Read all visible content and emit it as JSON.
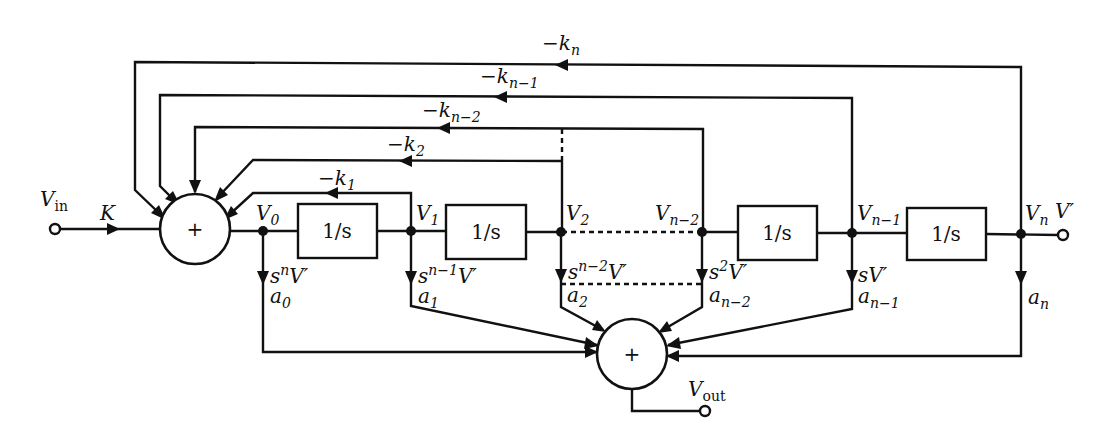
{
  "diagram": {
    "type": "block-diagram",
    "title": "",
    "input": {
      "label": "V",
      "sub": "in",
      "gain": "K"
    },
    "output": {
      "label": "V",
      "sub": "out"
    },
    "summers": {
      "input_sum": "+",
      "output_sum": "+"
    },
    "integrators": [
      "1/s",
      "1/s",
      "1/s",
      "1/s"
    ],
    "nodes": [
      {
        "id": "V0",
        "label": "V",
        "sub": "0",
        "tap": "s",
        "tap_sup": "n",
        "tap_tail": "V′",
        "coef": "a",
        "coef_sub": "0"
      },
      {
        "id": "V1",
        "label": "V",
        "sub": "1",
        "tap": "s",
        "tap_sup": "n−1",
        "tap_tail": "V′",
        "coef": "a",
        "coef_sub": "1"
      },
      {
        "id": "V2",
        "label": "V",
        "sub": "2",
        "tap": "s",
        "tap_sup": "n−2",
        "tap_tail": "V′",
        "coef": "a",
        "coef_sub": "2"
      },
      {
        "id": "Vn-2",
        "label": "V",
        "sub": "n−2",
        "tap": "s",
        "tap_sup": "2",
        "tap_tail": "V′",
        "coef": "a",
        "coef_sub": "n−2"
      },
      {
        "id": "Vn-1",
        "label": "V",
        "sub": "n−1",
        "tap": "sV′",
        "tap_sup": "",
        "tap_tail": "",
        "coef": "a",
        "coef_sub": "n−1"
      },
      {
        "id": "Vn",
        "label": "V",
        "sub": "n",
        "extra": "V′",
        "coef": "a",
        "coef_sub": "n"
      }
    ],
    "feedback": [
      {
        "label": "−k",
        "sub": "1"
      },
      {
        "label": "−k",
        "sub": "2"
      },
      {
        "label": "−k",
        "sub": "n−2"
      },
      {
        "label": "−k",
        "sub": "n−1"
      },
      {
        "label": "−k",
        "sub": "n"
      }
    ]
  }
}
